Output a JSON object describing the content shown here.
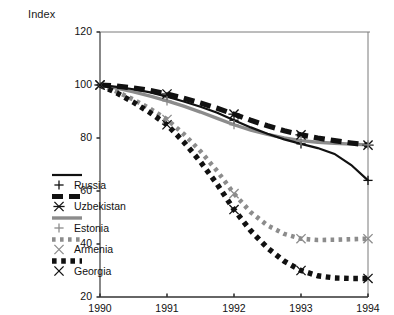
{
  "chart_data": {
    "type": "line",
    "title": "",
    "ylabel": "Index",
    "xlabel": "",
    "ylim": [
      20,
      120
    ],
    "xlim": [
      1990,
      1994
    ],
    "yticks": [
      20,
      40,
      60,
      80,
      100,
      120
    ],
    "ytick_labels": [
      "20",
      "40",
      "60",
      "80",
      "100",
      "120"
    ],
    "xticks": [
      1990,
      1991,
      1992,
      1993,
      1994
    ],
    "xtick_labels": [
      "1990",
      "1991",
      "1992",
      "1993",
      "1994"
    ],
    "grid": false,
    "legend_position": "lower left",
    "x": [
      1990,
      1994
    ],
    "series": [
      {
        "name": "Russia",
        "marker": "plus",
        "line_style": "solid-thin",
        "color": "#111111",
        "points": [
          {
            "x": 1990.0,
            "y": 100.0
          },
          {
            "x": 1990.25,
            "y": 99.3
          },
          {
            "x": 1990.5,
            "y": 98.4
          },
          {
            "x": 1990.75,
            "y": 97.2
          },
          {
            "x": 1991.0,
            "y": 95.6
          },
          {
            "x": 1991.25,
            "y": 93.8
          },
          {
            "x": 1991.5,
            "y": 91.8
          },
          {
            "x": 1991.75,
            "y": 89.5
          },
          {
            "x": 1992.0,
            "y": 86.7
          },
          {
            "x": 1992.25,
            "y": 84.0
          },
          {
            "x": 1992.5,
            "y": 81.6
          },
          {
            "x": 1992.75,
            "y": 79.5
          },
          {
            "x": 1993.0,
            "y": 77.8
          },
          {
            "x": 1993.25,
            "y": 76.2
          },
          {
            "x": 1993.5,
            "y": 74.0
          },
          {
            "x": 1993.75,
            "y": 69.8
          },
          {
            "x": 1994.0,
            "y": 64.0
          }
        ]
      },
      {
        "name": "Uzbekistan",
        "marker": "asterisk",
        "line_style": "dashed-thick",
        "color": "#111111",
        "points": [
          {
            "x": 1990.0,
            "y": 100.0
          },
          {
            "x": 1990.25,
            "y": 99.6
          },
          {
            "x": 1990.5,
            "y": 98.9
          },
          {
            "x": 1990.75,
            "y": 97.9
          },
          {
            "x": 1991.0,
            "y": 96.6
          },
          {
            "x": 1991.25,
            "y": 95.0
          },
          {
            "x": 1991.5,
            "y": 93.2
          },
          {
            "x": 1991.75,
            "y": 91.2
          },
          {
            "x": 1992.0,
            "y": 89.0
          },
          {
            "x": 1992.25,
            "y": 86.7
          },
          {
            "x": 1992.5,
            "y": 84.6
          },
          {
            "x": 1992.75,
            "y": 82.7
          },
          {
            "x": 1993.0,
            "y": 81.2
          },
          {
            "x": 1993.25,
            "y": 80.0
          },
          {
            "x": 1993.5,
            "y": 79.0
          },
          {
            "x": 1993.75,
            "y": 78.1
          },
          {
            "x": 1994.0,
            "y": 77.3
          }
        ]
      },
      {
        "name": "Estonia",
        "marker": "plus",
        "line_style": "solid-gray",
        "color": "#8c8c8c",
        "points": [
          {
            "x": 1990.0,
            "y": 100.0
          },
          {
            "x": 1990.25,
            "y": 98.8
          },
          {
            "x": 1990.5,
            "y": 97.4
          },
          {
            "x": 1990.75,
            "y": 95.8
          },
          {
            "x": 1991.0,
            "y": 94.0
          },
          {
            "x": 1991.25,
            "y": 92.0
          },
          {
            "x": 1991.5,
            "y": 89.8
          },
          {
            "x": 1991.75,
            "y": 87.4
          },
          {
            "x": 1992.0,
            "y": 85.0
          },
          {
            "x": 1992.25,
            "y": 83.0
          },
          {
            "x": 1992.5,
            "y": 81.4
          },
          {
            "x": 1992.75,
            "y": 80.0
          },
          {
            "x": 1993.0,
            "y": 79.0
          },
          {
            "x": 1993.25,
            "y": 78.4
          },
          {
            "x": 1993.5,
            "y": 78.0
          },
          {
            "x": 1993.75,
            "y": 77.7
          },
          {
            "x": 1994.0,
            "y": 77.4
          }
        ]
      },
      {
        "name": "Armenia",
        "marker": "cross",
        "line_style": "dotted-gray",
        "color": "#8c8c8c",
        "points": [
          {
            "x": 1990.0,
            "y": 100.0
          },
          {
            "x": 1990.25,
            "y": 97.5
          },
          {
            "x": 1990.5,
            "y": 94.5
          },
          {
            "x": 1990.75,
            "y": 91.0
          },
          {
            "x": 1991.0,
            "y": 87.0
          },
          {
            "x": 1991.25,
            "y": 81.5
          },
          {
            "x": 1991.5,
            "y": 75.0
          },
          {
            "x": 1991.75,
            "y": 67.5
          },
          {
            "x": 1992.0,
            "y": 59.0
          },
          {
            "x": 1992.25,
            "y": 52.0
          },
          {
            "x": 1992.5,
            "y": 47.0
          },
          {
            "x": 1992.75,
            "y": 43.8
          },
          {
            "x": 1993.0,
            "y": 42.0
          },
          {
            "x": 1993.25,
            "y": 41.5
          },
          {
            "x": 1993.5,
            "y": 41.6
          },
          {
            "x": 1993.75,
            "y": 41.8
          },
          {
            "x": 1994.0,
            "y": 42.0
          }
        ]
      },
      {
        "name": "Georgia",
        "marker": "cross",
        "line_style": "dotted-black",
        "color": "#111111",
        "points": [
          {
            "x": 1990.0,
            "y": 100.0
          },
          {
            "x": 1990.25,
            "y": 97.0
          },
          {
            "x": 1990.5,
            "y": 93.5
          },
          {
            "x": 1990.75,
            "y": 89.5
          },
          {
            "x": 1991.0,
            "y": 85.0
          },
          {
            "x": 1991.25,
            "y": 78.5
          },
          {
            "x": 1991.5,
            "y": 71.0
          },
          {
            "x": 1991.75,
            "y": 62.5
          },
          {
            "x": 1992.0,
            "y": 53.0
          },
          {
            "x": 1992.25,
            "y": 45.0
          },
          {
            "x": 1992.5,
            "y": 38.5
          },
          {
            "x": 1992.75,
            "y": 33.5
          },
          {
            "x": 1993.0,
            "y": 30.0
          },
          {
            "x": 1993.25,
            "y": 28.0
          },
          {
            "x": 1993.5,
            "y": 27.2
          },
          {
            "x": 1993.75,
            "y": 27.0
          },
          {
            "x": 1994.0,
            "y": 27.0
          }
        ]
      }
    ]
  },
  "legend": {
    "items": [
      {
        "label": "Russia"
      },
      {
        "label": "Uzbekistan"
      },
      {
        "label": "Estonia"
      },
      {
        "label": "Armenia"
      },
      {
        "label": "Georgia"
      }
    ]
  }
}
